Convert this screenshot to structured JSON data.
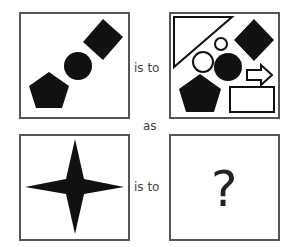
{
  "puzzle": {
    "relation_top": "is to",
    "connector": "as",
    "relation_bottom": "is to",
    "unknown": "?",
    "panels": [
      {
        "id": "A",
        "shapes": [
          "black-pentagon",
          "black-circle",
          "black-diamond"
        ]
      },
      {
        "id": "B",
        "shapes": [
          "white-triangle",
          "white-circle-small",
          "white-circle-medium",
          "black-circle",
          "black-diamond",
          "black-pentagon",
          "white-arrow",
          "white-rectangle"
        ]
      },
      {
        "id": "C",
        "shapes": [
          "black-four-point-star"
        ]
      },
      {
        "id": "D",
        "shapes": [
          "question-mark"
        ]
      }
    ]
  },
  "colors": {
    "border": "#555555",
    "fill": "#111111",
    "text": "#444444"
  }
}
